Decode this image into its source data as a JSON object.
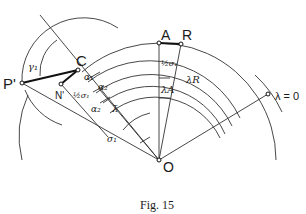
{
  "figure": {
    "caption": "Fig. 15",
    "stroke_color": "#333333",
    "background": "#ffffff"
  },
  "points": {
    "A": "A",
    "R": "R",
    "C": "C",
    "P": "P'",
    "N": "N'",
    "O": "O",
    "lambda_zero": "λ = 0"
  },
  "angles": {
    "gamma1": "γ₁",
    "sigma1_top": "σ₁",
    "half_sigma1_left": "½σ₁",
    "alpha1": "α₁",
    "alpha2_a": "α₂",
    "alpha2_b": "α₂",
    "lambda_bar": "λ̄",
    "sigma1_bottom": "σ₁",
    "half_sigma1_top": "½σ₁",
    "lambda_R": "λR",
    "lambda_A": "λA"
  }
}
